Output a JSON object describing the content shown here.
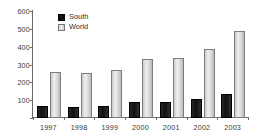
{
  "chart_data": {
    "type": "bar",
    "title": "",
    "xlabel": "",
    "ylabel": "",
    "categories": [
      "1997",
      "1998",
      "1999",
      "2000",
      "2001",
      "2002",
      "2003"
    ],
    "series": [
      {
        "name": "South",
        "color": "#121212",
        "values": [
          70,
          62,
          68,
          88,
          90,
          108,
          135
        ]
      },
      {
        "name": "World",
        "color": "#d9d9d9",
        "values": [
          258,
          255,
          268,
          333,
          338,
          385,
          490
        ]
      }
    ],
    "ylim": [
      0,
      600
    ],
    "yticks": [
      0,
      100,
      200,
      300,
      400,
      500,
      600
    ],
    "ytick_labels": [
      "",
      "100",
      "200",
      "300",
      "400",
      "500",
      "600"
    ],
    "grid": false,
    "legend_position": "top-left"
  },
  "legend": {
    "items": [
      {
        "label": "South",
        "swatch": "south-swatch"
      },
      {
        "label": "World",
        "swatch": "world-swatch"
      }
    ]
  }
}
